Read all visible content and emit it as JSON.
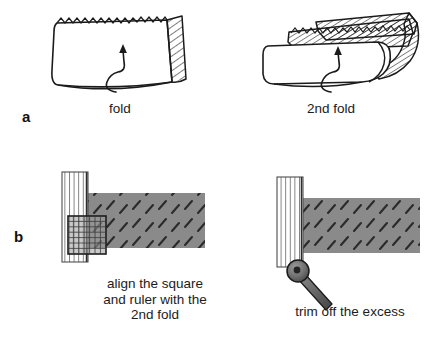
{
  "figure": {
    "background_color": "#ffffff",
    "width": 444,
    "height": 351
  },
  "panels": [
    {
      "letter": "a",
      "steps": [
        {
          "caption": "fold",
          "illustration": "fabric-single-fold",
          "description": "Rectangular folded fabric with hatched right edge, serrated top edge and a curved upward arrow indicating the fold direction"
        },
        {
          "caption": "2nd fold",
          "illustration": "fabric-second-fold",
          "description": "Fabric folded a second time showing two stacked hatched layers and a curved upward arrow"
        }
      ]
    },
    {
      "letter": "b",
      "steps": [
        {
          "caption": "align the square\nand ruler with the\n2nd fold",
          "illustration": "ruler-square-alignment",
          "description": "Gray fabric rectangle with a vertical striped ruler on the left edge and a gridded square overlapping the lower-left corner"
        },
        {
          "caption": "trim off the excess",
          "illustration": "rotary-cutter-trim",
          "description": "Gray fabric rectangle with a vertical striped ruler on the left edge and a rotary cutter positioned below the edge"
        }
      ]
    }
  ],
  "colors": {
    "ink": "#1b1b1b",
    "fabric_gray": "#8a8a8a",
    "fabric_dash": "#2e2e2e",
    "ruler_line": "#555555",
    "ruler_fill": "#ffffff",
    "square_grid": "#3a3a3a",
    "square_border": "#1d1d1d",
    "cutter_body": "#6d6d6d",
    "cutter_outline": "#1b1b1b"
  }
}
